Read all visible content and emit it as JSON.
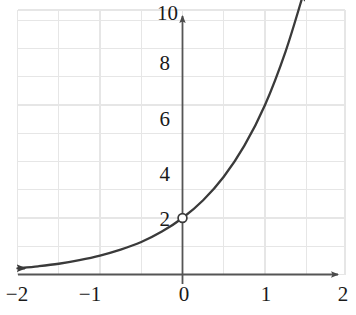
{
  "chart_data": {
    "type": "line",
    "title": "",
    "xlabel": "",
    "ylabel": "",
    "xlim": [
      -2,
      2
    ],
    "ylim": [
      0,
      10
    ],
    "grid": true,
    "grid_x_step": 0.5,
    "grid_y_step": 1,
    "legend": "none",
    "x_ticks": [
      {
        "value": -2,
        "label": "−2"
      },
      {
        "value": -1,
        "label": "−1"
      },
      {
        "value": 0,
        "label": "0"
      },
      {
        "value": 1,
        "label": "1"
      },
      {
        "value": 2,
        "label": "2"
      }
    ],
    "y_ticks": [
      {
        "value": 2,
        "label": "2"
      },
      {
        "value": 4,
        "label": "4"
      },
      {
        "value": 6,
        "label": "6"
      },
      {
        "value": 8,
        "label": "8"
      },
      {
        "value": 10,
        "label": "10"
      }
    ],
    "series": [
      {
        "name": "exponential-curve",
        "equation": "y = 2 * 3^x",
        "color": "#3a3a3a",
        "arrow_start": true,
        "arrow_end": true,
        "x_start": -2.0,
        "x_end": 1.47,
        "points": [
          {
            "x": -2.0,
            "y": 0.22
          },
          {
            "x": -1.75,
            "y": 0.29
          },
          {
            "x": -1.5,
            "y": 0.38
          },
          {
            "x": -1.25,
            "y": 0.51
          },
          {
            "x": -1.0,
            "y": 0.67
          },
          {
            "x": -0.75,
            "y": 0.88
          },
          {
            "x": -0.5,
            "y": 1.15
          },
          {
            "x": -0.25,
            "y": 1.52
          },
          {
            "x": 0.0,
            "y": 2.0
          },
          {
            "x": 0.25,
            "y": 2.63
          },
          {
            "x": 0.5,
            "y": 3.46
          },
          {
            "x": 0.75,
            "y": 4.56
          },
          {
            "x": 1.0,
            "y": 6.0
          },
          {
            "x": 1.25,
            "y": 7.9
          },
          {
            "x": 1.47,
            "y": 9.98
          }
        ]
      }
    ],
    "markers": [
      {
        "name": "open-point-y-intercept",
        "x": 0,
        "y": 2,
        "style": "open-circle",
        "fill": "#ffffff",
        "stroke": "#3a3a3a"
      }
    ],
    "axes": {
      "x_axis_color": "#555555",
      "y_axis_color": "#555555",
      "grid_color": "#e6e6e6",
      "x_axis_arrow": "right",
      "y_axis_arrow": "up"
    }
  }
}
